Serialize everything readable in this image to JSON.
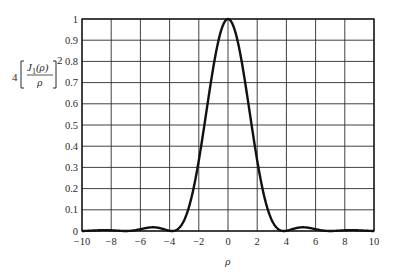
{
  "chart_data": {
    "type": "line",
    "title": "",
    "xlabel": "ρ",
    "ylabel": "4[J1(ρ)/ρ]^2",
    "ylabel_parts": {
      "coef": "4",
      "numerator": "J",
      "numerator_sub": "1",
      "numerator_arg": "(ρ)",
      "denominator": "ρ",
      "power": "2"
    },
    "xlim": [
      -10,
      10
    ],
    "ylim": [
      0,
      1
    ],
    "grid": true,
    "legend": null,
    "x_ticks": [
      "−10",
      "−8",
      "−6",
      "−4",
      "−2",
      "0",
      "2",
      "4",
      "6",
      "8",
      "10"
    ],
    "x_tick_values": [
      -10,
      -8,
      -6,
      -4,
      -2,
      0,
      2,
      4,
      6,
      8,
      10
    ],
    "y_ticks": [
      "0",
      "0.1",
      "0.2",
      "0.3",
      "0.4",
      "0.5",
      "0.6",
      "0.7",
      "0.8",
      "0.9",
      "1"
    ],
    "y_tick_values": [
      0,
      0.1,
      0.2,
      0.3,
      0.4,
      0.5,
      0.6,
      0.7,
      0.8,
      0.9,
      1.0
    ],
    "series": [
      {
        "name": "4[J1(ρ)/ρ]^2",
        "color": "#111111",
        "x": [
          -10,
          -9,
          -8.42,
          -8,
          -7.02,
          -6,
          -5.14,
          -4.5,
          -3.83,
          -3.5,
          -3,
          -2.5,
          -2,
          -1.5,
          -1,
          -0.5,
          0,
          0.5,
          1,
          1.5,
          2,
          2.5,
          3,
          3.5,
          3.83,
          4.5,
          5.14,
          6,
          7.02,
          8,
          8.42,
          9,
          10
        ],
        "y": [
          0.0002,
          0.0024,
          0.0042,
          0.0034,
          0.0,
          0.0085,
          0.0175,
          0.0107,
          0.0,
          0.0045,
          0.0505,
          0.157,
          0.3326,
          0.5502,
          0.7744,
          0.9397,
          1.0,
          0.9397,
          0.7744,
          0.5502,
          0.3326,
          0.157,
          0.0505,
          0.0045,
          0.0,
          0.0107,
          0.0175,
          0.0085,
          0.0,
          0.0034,
          0.0042,
          0.0024,
          0.0002
        ]
      }
    ]
  },
  "colors": {
    "curve": "#111111",
    "grid": "#2b2b2b",
    "frame": "#1a1a1a",
    "background": "#ffffff"
  }
}
